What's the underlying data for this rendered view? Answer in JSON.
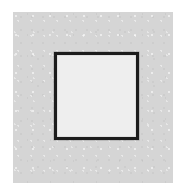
{
  "figure": {
    "name": "square-outline-figure",
    "canvas": {
      "width_px": 173,
      "height_px": 183,
      "background_color": "#ffffff"
    },
    "panel": {
      "name": "gray-panel",
      "fill_color": "#d5d5d5",
      "left_px": 13,
      "top_px": 12,
      "right_px": 173,
      "bottom_px": 183,
      "texture": "paper-grain"
    },
    "square": {
      "name": "square-shape",
      "stroke_color": "#1c1c1c",
      "stroke_width_px": 3,
      "fill_color": "#eeeeee",
      "left_px": 54,
      "top_px": 52,
      "right_px": 139,
      "bottom_px": 140,
      "width_px": 85,
      "height_px": 88
    }
  }
}
